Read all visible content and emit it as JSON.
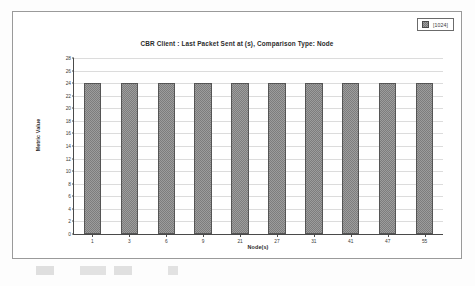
{
  "chart_data": {
    "type": "bar",
    "title": "CBR Client :  Last Packet Sent at (s), Comparison Type: Node",
    "xlabel": "Node(s)",
    "ylabel": "Metric Value",
    "categories": [
      "1",
      "3",
      "6",
      "9",
      "21",
      "27",
      "31",
      "41",
      "47",
      "55"
    ],
    "values": [
      24,
      24,
      24,
      24,
      24,
      24,
      24,
      24,
      24,
      24
    ],
    "ylim": [
      0,
      28
    ],
    "yticks": [
      0,
      2,
      4,
      6,
      8,
      10,
      12,
      14,
      16,
      18,
      20,
      22,
      24,
      26,
      28
    ],
    "grid": true,
    "legend": {
      "position": "top-right",
      "entries": [
        {
          "label": "[1024]",
          "swatch": "gray-checkered"
        }
      ]
    },
    "series": [
      {
        "name": "[1024]",
        "values": [
          24,
          24,
          24,
          24,
          24,
          24,
          24,
          24,
          24,
          24
        ]
      }
    ]
  }
}
